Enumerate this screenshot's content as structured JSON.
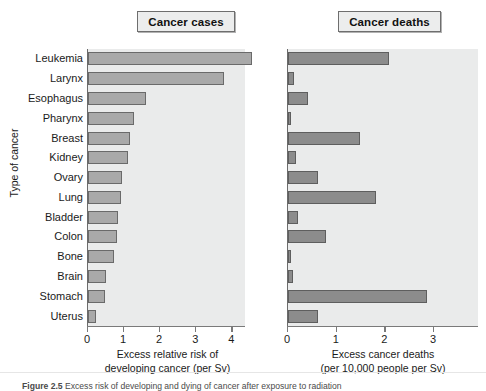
{
  "figure": {
    "y_axis_title": "Type of cancer",
    "caption_label": "Figure 2.5",
    "caption_text": "Excess risk of developing and dying of cancer after exposure to radiation"
  },
  "panels": [
    {
      "key": "cases",
      "title": "Cancer cases",
      "xlabel_line1": "Excess relative risk of",
      "xlabel_line2": "developing cancer (per Sv)",
      "ticks": [
        "0",
        "1",
        "2",
        "3",
        "4"
      ]
    },
    {
      "key": "deaths",
      "title": "Cancer deaths",
      "xlabel_line1": "Excess cancer deaths",
      "xlabel_line2": "(per 10,000 people per Sv)",
      "ticks": [
        "0",
        "1",
        "2",
        "3"
      ]
    }
  ],
  "categories": [
    "Leukemia",
    "Larynx",
    "Esophagus",
    "Pharynx",
    "Breast",
    "Kidney",
    "Ovary",
    "Lung",
    "Bladder",
    "Colon",
    "Bone",
    "Brain",
    "Stomach",
    "Uterus"
  ],
  "chart_data": [
    {
      "type": "bar",
      "title": "Cancer cases",
      "orientation": "horizontal",
      "categories": [
        "Leukemia",
        "Larynx",
        "Esophagus",
        "Pharynx",
        "Breast",
        "Kidney",
        "Ovary",
        "Lung",
        "Bladder",
        "Colon",
        "Bone",
        "Brain",
        "Stomach",
        "Uterus"
      ],
      "values": [
        4.55,
        3.78,
        1.6,
        1.28,
        1.15,
        1.12,
        0.95,
        0.92,
        0.82,
        0.8,
        0.73,
        0.5,
        0.48,
        0.23
      ],
      "xlabel": "Excess relative risk of developing cancer (per Sv)",
      "ylabel": "Type of cancer",
      "xlim": [
        0,
        4.35
      ],
      "xticks": [
        0,
        1,
        2,
        3,
        4
      ],
      "grid": false,
      "legend": "none",
      "bar_color": "#a9a9a9",
      "bar_edge_color": "#6a6a6a"
    },
    {
      "type": "bar",
      "title": "Cancer deaths",
      "orientation": "horizontal",
      "categories": [
        "Leukemia",
        "Larynx",
        "Esophagus",
        "Pharynx",
        "Breast",
        "Kidney",
        "Ovary",
        "Lung",
        "Bladder",
        "Colon",
        "Bone",
        "Brain",
        "Stomach",
        "Uterus"
      ],
      "values": [
        2.08,
        0.13,
        0.42,
        0.04,
        1.48,
        0.17,
        0.62,
        1.8,
        0.21,
        0.78,
        0.05,
        0.1,
        2.85,
        0.62
      ],
      "xlabel": "Excess cancer deaths (per 10,000 people per Sv)",
      "ylabel": "Type of cancer",
      "xlim": [
        0,
        3.9
      ],
      "xticks": [
        0,
        1,
        2,
        3
      ],
      "grid": false,
      "legend": "none",
      "bar_color": "#8c8c8c",
      "bar_edge_color": "#5e5e5e"
    }
  ],
  "colors": {
    "plot_background": "#eaebeb",
    "title_box_background": "#eceded",
    "axis": "#7a7a7a",
    "text": "#1a1a1a"
  }
}
